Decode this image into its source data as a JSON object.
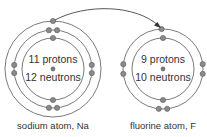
{
  "diagram": {
    "atoms": [
      {
        "id": "sodium",
        "label": "sodium atom, Na",
        "protons_text": "11 protons",
        "neutrons_text": "12 neutrons",
        "shells": [
          {
            "electrons": 2,
            "angles": [
              90,
              270
            ]
          },
          {
            "electrons": 8,
            "angles": [
              84,
              96,
              264,
              276,
              174,
              186,
              -6,
              6
            ]
          },
          {
            "electrons": 1,
            "angles": [
              90
            ]
          }
        ]
      },
      {
        "id": "fluorine",
        "label": "fluorine atom, F",
        "protons_text": "9 protons",
        "neutrons_text": "10 neutrons",
        "shells": [
          {
            "electrons": 2,
            "angles": [
              90,
              270
            ]
          },
          {
            "electrons": 7,
            "angles": [
              92,
              264,
              276,
              173,
              187,
              -7,
              7
            ]
          }
        ]
      }
    ],
    "arrow": {
      "from": "sodium outer-shell electron",
      "to": "fluorine outer shell"
    }
  },
  "colors": {
    "shell": "#6b6b6b",
    "electron": "#8a8a8a",
    "text": "#333333"
  }
}
